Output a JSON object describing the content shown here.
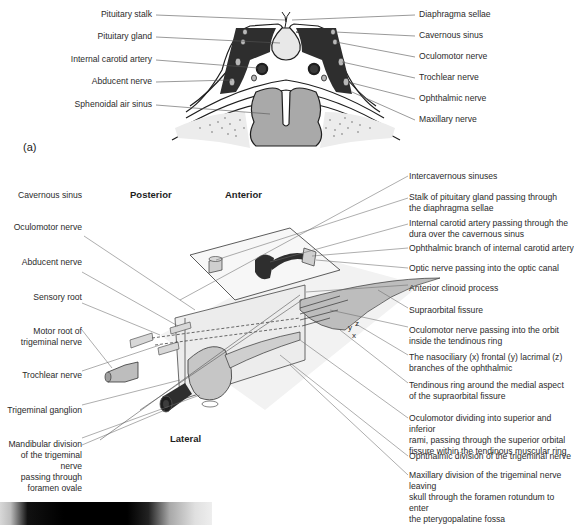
{
  "figure_a": {
    "panel_label": "(a)",
    "left_labels": [
      {
        "text": "Pituitary stalk"
      },
      {
        "text": "Pituitary gland"
      },
      {
        "text": "Internal carotid artery"
      },
      {
        "text": "Abducent nerve"
      },
      {
        "text": "Sphenoidal air sinus"
      }
    ],
    "right_labels": [
      {
        "text": "Diaphragma sellae"
      },
      {
        "text": "Cavernous sinus"
      },
      {
        "text": "Oculomotor nerve"
      },
      {
        "text": "Trochlear nerve"
      },
      {
        "text": "Ophthalmic nerve"
      },
      {
        "text": "Maxillary nerve"
      }
    ]
  },
  "figure_b": {
    "orientation": {
      "posterior": "Posterior",
      "anterior": "Anterior",
      "lateral": "Lateral"
    },
    "left_labels": [
      {
        "text": "Cavernous sinus"
      },
      {
        "text": "Oculomotor nerve"
      },
      {
        "text": "Abducent nerve"
      },
      {
        "text": "Sensory root"
      },
      {
        "text": "Motor root of\ntrigeminal nerve"
      },
      {
        "text": "Trochlear nerve"
      },
      {
        "text": "Trigeminal ganglion"
      },
      {
        "text": "Mandibular division\nof the trigeminal nerve\npassing through\nforamen ovale"
      }
    ],
    "right_labels": [
      {
        "text": "Intercavernous sinuses"
      },
      {
        "text": "Stalk of pituitary gland passing through\nthe diaphragma sellae"
      },
      {
        "text": "Internal carotid artery passing through the\ndura over the cavernous sinus"
      },
      {
        "text": "Ophthalmic branch of internal carotid artery"
      },
      {
        "text": "Optic nerve passing into the optic canal"
      },
      {
        "text": "Anterior clinoid process"
      },
      {
        "text": "Supraorbital fissure"
      },
      {
        "text": "Oculomotor nerve passing into the orbit\ninside the tendinous ring"
      },
      {
        "text": "The nasociliary (x) frontal (y) lacrimal (z)\nbranches of the ophthalmic"
      },
      {
        "text": "Tendinous ring around the medial aspect\nof the supraorbital fissure"
      },
      {
        "text": "Oculomotor dividing into superior and inferior\n rami, passing through the superior orbital\nfissure within the tendinous muscular ring"
      },
      {
        "text": "Ophthalmic division of the trigeminal nerve"
      },
      {
        "text": "Maxillary division of the trigeminal nerve leaving\nskull through the foramen rotundum to enter\nthe pterygopalatine fossa"
      }
    ],
    "branch_letters": {
      "x": "x",
      "y": "y",
      "z": "z"
    }
  },
  "colors": {
    "dark_fill": "#2e2e2e",
    "mid_fill": "#a9a9a9",
    "light_fill": "#dcdcdc",
    "line": "#6b6b6b",
    "text": "#2b2b2b"
  }
}
